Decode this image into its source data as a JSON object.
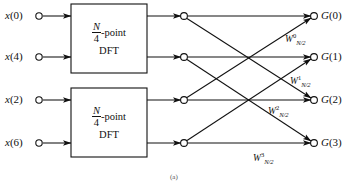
{
  "figure": {
    "type": "signal-flow-graph",
    "background_color": "#ffffff",
    "line_color": "#111111",
    "text_color": "#111111"
  },
  "inputs": [
    {
      "name": "x0",
      "label_var": "x",
      "label_index": "(0)",
      "y": 16
    },
    {
      "name": "x4",
      "label_var": "x",
      "label_index": "(4)",
      "y": 57
    },
    {
      "name": "x2",
      "label_var": "x",
      "label_index": "(2)",
      "y": 100
    },
    {
      "name": "x6",
      "label_var": "x",
      "label_index": "(6)",
      "y": 143
    }
  ],
  "blocks": [
    {
      "name": "dft-block-top",
      "numerator": "N",
      "denominator": "4",
      "suffix": "-point",
      "second_line": "DFT",
      "x": 71,
      "y": 4,
      "w": 76,
      "h": 69
    },
    {
      "name": "dft-block-bottom",
      "numerator": "N",
      "denominator": "4",
      "suffix": "-point",
      "second_line": "DFT",
      "x": 71,
      "y": 88,
      "w": 76,
      "h": 69
    }
  ],
  "outputs": [
    {
      "name": "G0",
      "label_var": "G",
      "label_index": "(0)",
      "y": 16
    },
    {
      "name": "G1",
      "label_var": "G",
      "label_index": "(1)",
      "y": 57
    },
    {
      "name": "G2",
      "label_var": "G",
      "label_index": "(2)",
      "y": 100
    },
    {
      "name": "G3",
      "label_var": "G",
      "label_index": "(3)",
      "y": 143
    }
  ],
  "twiddles": [
    {
      "name": "w0",
      "base": "W",
      "sup": "0",
      "sub": "N/2",
      "x": 285,
      "y": 36
    },
    {
      "name": "w1",
      "base": "W",
      "sup": "1",
      "sub": "N/2",
      "x": 290,
      "y": 78
    },
    {
      "name": "w2",
      "base": "W",
      "sup": "2",
      "sub": "N/2",
      "x": 268,
      "y": 108
    },
    {
      "name": "w3",
      "base": "W",
      "sup": "3",
      "sub": "N/2",
      "x": 253,
      "y": 155
    }
  ],
  "nodes": {
    "mid_x": 184,
    "out_x": 314,
    "radius": 3.4
  },
  "caption": "(a)"
}
